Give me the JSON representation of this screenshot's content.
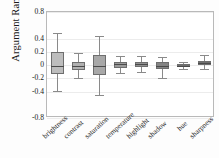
{
  "chart_data": {
    "type": "box",
    "title": "",
    "xlabel": "",
    "ylabel": "Argument Range",
    "ylim": [
      -0.8,
      0.8
    ],
    "ytick_labels": [
      "0.8",
      "0.4",
      "0.2",
      "0",
      "-0.2",
      "-0.4",
      "-0.8"
    ],
    "ytick_values": [
      0.8,
      0.4,
      0.2,
      0,
      -0.2,
      -0.4,
      -0.8
    ],
    "grid": true,
    "legend": "none",
    "categories": [
      "brightness",
      "contrast",
      "saturation",
      "temperature",
      "highlight",
      "shadow",
      "hue",
      "sharpness"
    ],
    "boxes": [
      {
        "category": "brightness",
        "whisker_low": -0.39,
        "q1": -0.14,
        "median": -0.02,
        "q3": 0.2,
        "whisker_high": 0.49,
        "fill": "#bdbdbd"
      },
      {
        "category": "contrast",
        "whisker_low": -0.2,
        "q1": -0.07,
        "median": -0.02,
        "q3": 0.05,
        "whisker_high": 0.18,
        "fill": "#b0b0b0"
      },
      {
        "category": "saturation",
        "whisker_low": -0.46,
        "q1": -0.15,
        "median": -0.02,
        "q3": 0.15,
        "whisker_high": 0.44,
        "fill": "#a8a8a8"
      },
      {
        "category": "temperature",
        "whisker_low": -0.12,
        "q1": -0.04,
        "median": 0.01,
        "q3": 0.05,
        "whisker_high": 0.14,
        "fill": "#9a9a9a"
      },
      {
        "category": "highlight",
        "whisker_low": -0.11,
        "q1": -0.03,
        "median": 0.01,
        "q3": 0.05,
        "whisker_high": 0.13,
        "fill": "#919191"
      },
      {
        "category": "shadow",
        "whisker_low": -0.19,
        "q1": -0.06,
        "median": -0.01,
        "q3": 0.04,
        "whisker_high": 0.12,
        "fill": "#848484"
      },
      {
        "category": "hue",
        "whisker_low": -0.06,
        "q1": -0.02,
        "median": -0.01,
        "q3": 0.01,
        "whisker_high": 0.05,
        "fill": "#7a7a7a"
      },
      {
        "category": "sharpness",
        "whisker_low": -0.06,
        "q1": 0.0,
        "median": 0.03,
        "q3": 0.06,
        "whisker_high": 0.15,
        "fill": "#6f6f6f"
      }
    ]
  }
}
